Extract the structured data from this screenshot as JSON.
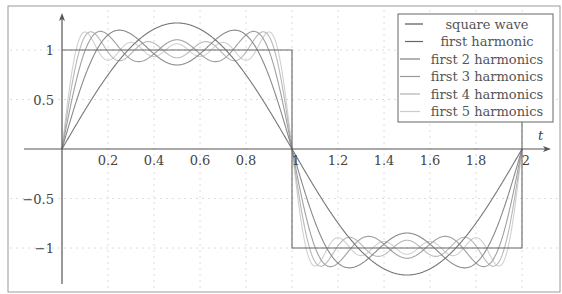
{
  "chart_data": {
    "type": "line",
    "title": "",
    "xlabel": "t",
    "ylabel": "",
    "xlim": [
      0,
      2.15
    ],
    "ylim": [
      -1.33,
      1.33
    ],
    "grid": true,
    "grid_style": "dotted",
    "legend_position": "upper right",
    "x_ticks": [
      0.2,
      0.4,
      0.6,
      0.8,
      1,
      1.2,
      1.4,
      1.6,
      1.8,
      2
    ],
    "x_tick_labels": [
      "0.2",
      "0.4",
      "0.6",
      "0.8",
      "1",
      "1.2",
      "1.4",
      "1.6",
      "1.8",
      "2"
    ],
    "y_ticks": [
      -1,
      -0.5,
      0.5,
      1
    ],
    "y_tick_labels": [
      "−1",
      "−0.5",
      "0.5",
      "1"
    ],
    "series": [
      {
        "name": "square wave",
        "kind": "square",
        "harmonics": 0,
        "color": "#666666",
        "points": [
          [
            0,
            1
          ],
          [
            1,
            1
          ],
          [
            1,
            -1
          ],
          [
            2,
            -1
          ],
          [
            2,
            1
          ]
        ]
      },
      {
        "name": "first harmonic",
        "kind": "fourier",
        "harmonics": 1,
        "color": "#777777",
        "peak": 1.273
      },
      {
        "name": "first 2 harmonics",
        "kind": "fourier",
        "harmonics": 2,
        "color": "#8a8a8a"
      },
      {
        "name": "first 3 harmonics",
        "kind": "fourier",
        "harmonics": 3,
        "color": "#a0a0a0"
      },
      {
        "name": "first 4 harmonics",
        "kind": "fourier",
        "harmonics": 4,
        "color": "#b8b8b8"
      },
      {
        "name": "first 5 harmonics",
        "kind": "fourier",
        "harmonics": 5,
        "color": "#d0d0d0"
      }
    ]
  },
  "legend": {
    "items": [
      {
        "label": "square wave",
        "color": "#555555"
      },
      {
        "label": "first harmonic",
        "color": "#666666"
      },
      {
        "label": "first 2 harmonics",
        "color": "#808080"
      },
      {
        "label": "first 3 harmonics",
        "color": "#999999"
      },
      {
        "label": "first 4 harmonics",
        "color": "#b3b3b3"
      },
      {
        "label": "first 5 harmonics",
        "color": "#cccccc"
      }
    ]
  },
  "axis_label_t": "t"
}
